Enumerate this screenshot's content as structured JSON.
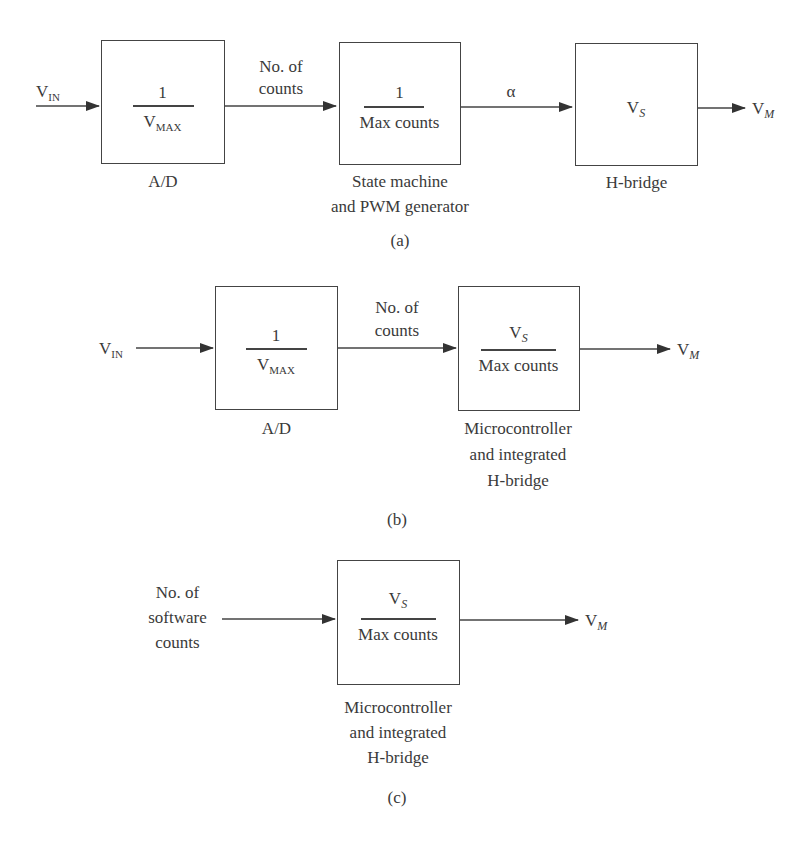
{
  "diagram_a": {
    "caption": "(a)",
    "input": {
      "symbol": "V",
      "sub": "IN"
    },
    "blocks": [
      {
        "numerator": "1",
        "denominator": "V",
        "denominator_sub": "MAX",
        "label": "A/D"
      },
      {
        "numerator": "1",
        "denominator": "Max counts",
        "label_line1": "State machine",
        "label_line2": "and PWM generator"
      },
      {
        "content": "V",
        "content_sub": "S",
        "label": "H-bridge"
      }
    ],
    "signals": {
      "between_1_2_line1": "No. of",
      "between_1_2_line2": "counts",
      "between_2_3": "α"
    },
    "output": {
      "symbol": "V",
      "sub": "M"
    }
  },
  "diagram_b": {
    "caption": "(b)",
    "input": {
      "symbol": "V",
      "sub": "IN"
    },
    "blocks": [
      {
        "numerator": "1",
        "denominator": "V",
        "denominator_sub": "MAX",
        "label": "A/D"
      },
      {
        "numerator": "V",
        "numerator_sub": "S",
        "denominator": "Max counts",
        "label_line1": "Microcontroller",
        "label_line2": "and integrated",
        "label_line3": "H-bridge"
      }
    ],
    "signals": {
      "between_1_2_line1": "No. of",
      "between_1_2_line2": "counts"
    },
    "output": {
      "symbol": "V",
      "sub": "M"
    }
  },
  "diagram_c": {
    "caption": "(c)",
    "input": {
      "line1": "No. of",
      "line2": "software",
      "line3": "counts"
    },
    "blocks": [
      {
        "numerator": "V",
        "numerator_sub": "S",
        "denominator": "Max counts",
        "label_line1": "Microcontroller",
        "label_line2": "and integrated",
        "label_line3": "H-bridge"
      }
    ],
    "output": {
      "symbol": "V",
      "sub": "M"
    }
  }
}
